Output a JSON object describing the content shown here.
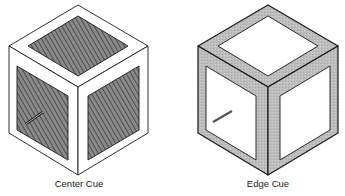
{
  "figures": [
    {
      "id": "center-cue",
      "caption": "Center Cue",
      "style": "hatched-inner-faces",
      "cursor": "diagonal-line-bottom-left-of-left-face"
    },
    {
      "id": "edge-cue",
      "caption": "Edge Cue",
      "style": "shaded-frame-borders",
      "cursor": "diagonal-line-in-left-face"
    }
  ],
  "colors": {
    "stroke": "#1a1a1a",
    "hatch_fill": "#6e6e6e",
    "frame_fill": "#b9b9b9",
    "background": "#ffffff"
  }
}
